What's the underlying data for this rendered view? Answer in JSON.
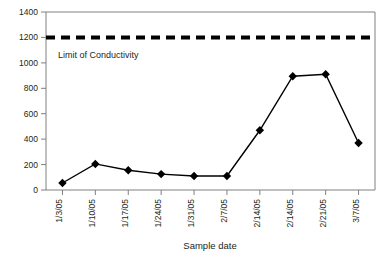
{
  "chart_data": {
    "type": "line",
    "title": "",
    "xlabel": "Sample date",
    "ylabel": "",
    "categories": [
      "1/3/05",
      "1/10/05",
      "1/17/05",
      "1/24/05",
      "1/31/05",
      "2/7/05",
      "2/14/05",
      "2/14/05",
      "2/21/05",
      "3/7/05"
    ],
    "values": [
      55,
      205,
      155,
      125,
      110,
      110,
      470,
      895,
      910,
      370
    ],
    "ylim": [
      0,
      1400
    ],
    "yticks": [
      0,
      200,
      400,
      600,
      800,
      1000,
      1200,
      1400
    ],
    "ytick_labels": [
      "0",
      "200",
      "400",
      "600",
      "800",
      "1000",
      "1200",
      "1400"
    ],
    "grid": false,
    "legend": "none",
    "marker": "diamond",
    "line_color": "#000000",
    "marker_color": "#000000",
    "annotations": [
      {
        "name": "limit-of-conductivity",
        "label": "Limit of Conductivity",
        "value": 1200,
        "style": "dashed-horizontal-line",
        "color": "#000000"
      }
    ]
  },
  "colors": {
    "background": "#ffffff",
    "axis": "#808080",
    "text": "#231f20",
    "series": "#000000"
  }
}
